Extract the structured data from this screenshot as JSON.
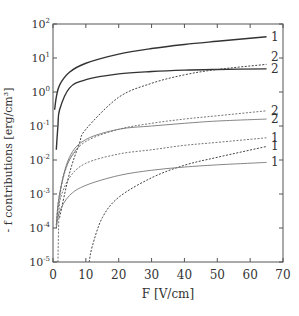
{
  "chart_data": {
    "type": "line",
    "title": "",
    "xlabel": "F [V/cm]",
    "ylabel": "- f contributions [erg/cm³]",
    "xscale": "linear",
    "yscale": "log",
    "xlim": [
      0,
      70
    ],
    "ylim": [
      1e-05,
      100
    ],
    "xticks": [
      0,
      10,
      20,
      30,
      40,
      50,
      60,
      70
    ],
    "yticks": [
      {
        "base": "10",
        "exp": "2"
      },
      {
        "base": "10",
        "exp": "1"
      },
      {
        "base": "10",
        "exp": "0"
      },
      {
        "base": "10",
        "exp": "-1"
      },
      {
        "base": "10",
        "exp": "-2"
      },
      {
        "base": "10",
        "exp": "-3"
      },
      {
        "base": "10",
        "exp": "-4"
      },
      {
        "base": "10",
        "exp": "-5"
      }
    ],
    "grid": false,
    "legend": "none (curves labeled 1/2 at right end)",
    "series": [
      {
        "name": "1",
        "style": "solid-thick",
        "x": [
          0.5,
          1,
          2,
          5,
          10,
          20,
          30,
          40,
          50,
          65
        ],
        "values": [
          0.3,
          0.7,
          1.6,
          3.8,
          7,
          13,
          19,
          25,
          31,
          42
        ]
      },
      {
        "name": "2",
        "style": "solid-thick",
        "x": [
          1,
          1.5,
          2,
          5,
          10,
          20,
          30,
          40,
          50,
          65
        ],
        "values": [
          0.02,
          0.1,
          0.3,
          1.3,
          2.3,
          3.4,
          4.0,
          4.4,
          4.6,
          4.8
        ]
      },
      {
        "name": "2",
        "style": "dashed",
        "x": [
          2,
          5,
          8,
          10,
          20,
          30,
          40,
          50,
          65
        ],
        "values": [
          0.0002,
          0.004,
          0.03,
          0.08,
          0.7,
          1.8,
          3.2,
          4.6,
          6.5
        ]
      },
      {
        "name": "2",
        "style": "dashed-thin",
        "x": [
          1,
          2,
          5,
          10,
          20,
          30,
          40,
          50,
          65
        ],
        "values": [
          0.00012,
          0.001,
          0.01,
          0.035,
          0.08,
          0.12,
          0.16,
          0.2,
          0.28
        ]
      },
      {
        "name": "2",
        "style": "solid-thin",
        "x": [
          1,
          2,
          5,
          10,
          20,
          30,
          40,
          50,
          65
        ],
        "values": [
          0.00012,
          0.001,
          0.012,
          0.04,
          0.08,
          0.1,
          0.12,
          0.14,
          0.16
        ]
      },
      {
        "name": "1",
        "style": "dashed-thin",
        "x": [
          1,
          2,
          5,
          10,
          20,
          30,
          40,
          50,
          65
        ],
        "values": [
          0.0001,
          0.0006,
          0.003,
          0.008,
          0.015,
          0.02,
          0.027,
          0.033,
          0.045
        ]
      },
      {
        "name": "1",
        "style": "dashed",
        "x": [
          11,
          12,
          15,
          20,
          30,
          40,
          50,
          65
        ],
        "values": [
          1e-05,
          3e-05,
          0.0002,
          0.0008,
          0.003,
          0.007,
          0.012,
          0.025
        ]
      },
      {
        "name": "1",
        "style": "solid-thin",
        "x": [
          1,
          2,
          5,
          10,
          20,
          30,
          40,
          50,
          65
        ],
        "values": [
          0.0001,
          0.0003,
          0.0009,
          0.0018,
          0.0035,
          0.005,
          0.0062,
          0.0072,
          0.0085
        ]
      },
      {
        "name": "1",
        "style": "dashed-thin",
        "x": [
          1.5,
          1.7,
          2,
          3,
          5,
          8
        ],
        "values": [
          1e-05,
          0.0001,
          0.0006,
          0.003,
          0.01,
          0.025
        ]
      }
    ],
    "end_labels": [
      {
        "text": "1",
        "y_value": 42
      },
      {
        "text": "2",
        "y_value": 11
      },
      {
        "text": "2",
        "y_value": 4.6
      },
      {
        "text": "2",
        "y_value": 0.28
      },
      {
        "text": "2",
        "y_value": 0.16
      },
      {
        "text": "1",
        "y_value": 0.045
      },
      {
        "text": "1",
        "y_value": 0.026
      },
      {
        "text": "1",
        "y_value": 0.0085
      }
    ]
  }
}
